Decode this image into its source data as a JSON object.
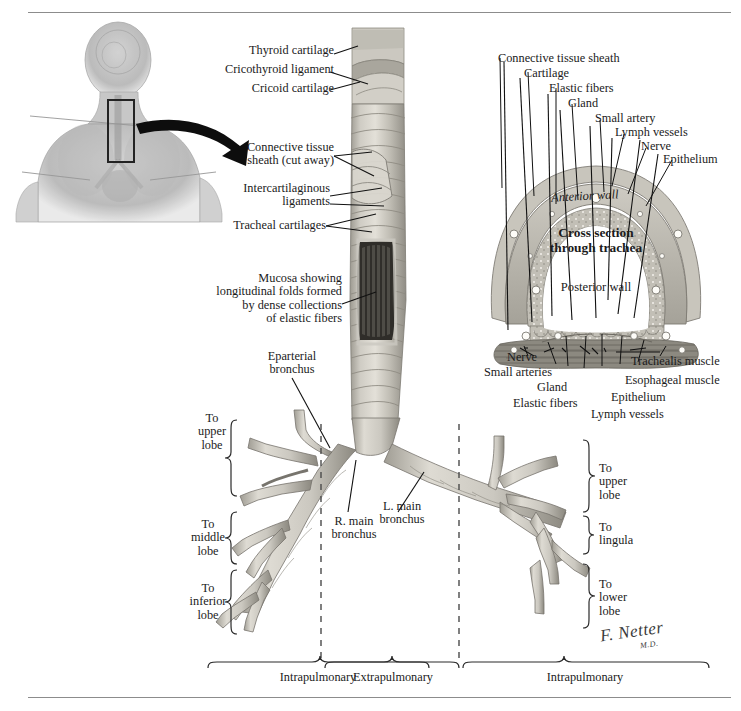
{
  "plate": {
    "title": "Trachea and Major Bronchi",
    "signature": "F. Netter",
    "signature_sub": "M.D."
  },
  "orientation_inset": {
    "name": "body-orientation-inset",
    "description": "Grayscale anterior/sagittal torso showing trachea location",
    "highlight_box": "trachea region"
  },
  "main_labels": {
    "thyroid_cartilage": "Thyroid cartilage",
    "cricothyroid_ligament": "Cricothyroid ligament",
    "cricoid_cartilage": "Cricoid cartilage",
    "connective_tissue_sheath": "Connective tissue\nsheath (cut away)",
    "intercartilaginous_ligaments": "Intercartilaginous\nligaments",
    "tracheal_cartilages": "Tracheal cartilages",
    "mucosa": "Mucosa showing\nlongitudinal folds formed\nby dense collections\nof elastic fibers",
    "eparterial_bronchus": "Eparterial\nbronchus",
    "r_main_bronchus": "R. main\nbronchus",
    "l_main_bronchus": "L. main\nbronchus"
  },
  "cross_section": {
    "center_title_line1": "Cross section",
    "center_title_line2": "through trachea",
    "anterior_wall": "Anterior wall",
    "posterior_wall": "Posterior wall",
    "upper_labels": [
      "Connective tissue sheath",
      "Cartilage",
      "Elastic fibers",
      "Gland",
      "Small artery",
      "Lymph vessels",
      "Nerve",
      "Epithelium"
    ],
    "lower_left_labels": [
      "Nerve",
      "Small arteries",
      "Gland",
      "Elastic fibers"
    ],
    "lower_right_labels": [
      "Trachealis muscle",
      "Esophageal muscle",
      "Epithelium",
      "Lymph vessels"
    ]
  },
  "lobe_brackets": {
    "left_side": [
      "To\nupper\nlobe",
      "To\nmiddle\nlobe",
      "To\ninferior\nlobe"
    ],
    "right_side": [
      "To\nupper\nlobe",
      "To\nlingula",
      "To\nlower\nlobe"
    ]
  },
  "bottom_brackets": [
    "Intrapulmonary",
    "Extrapulmonary",
    "Intrapulmonary"
  ],
  "colors": {
    "ink": "#1b1b1b",
    "rule": "#8c8c8c",
    "cartilage_light": "#d6d3cb",
    "cartilage_mid": "#b9b5ab",
    "cartilage_dark": "#8e8a80",
    "mucosa_dark": "#4a4843",
    "sheath": "#c9c6bd"
  }
}
